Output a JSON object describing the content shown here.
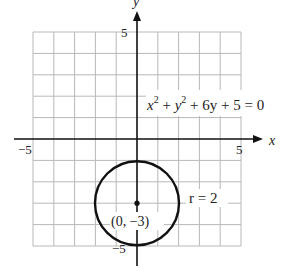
{
  "diagram": {
    "type": "circle-graph",
    "equation": {
      "base": "x",
      "parts": [
        "x",
        "2",
        " + ",
        "y",
        "2",
        " + 6y + 5 = 0"
      ]
    },
    "equation_text": "x² + y² + 6y + 5 = 0",
    "radius_label": "r = 2",
    "center_label": "(0, −3)",
    "axes": {
      "x_label": "x",
      "y_label": "y",
      "x_ticks": [
        "−5",
        "5"
      ],
      "y_ticks": [
        "5",
        "−5"
      ],
      "xlim": [
        -5,
        5
      ],
      "ylim": [
        -5,
        5
      ]
    },
    "circle": {
      "center": [
        0,
        -3
      ],
      "radius": 2
    },
    "colors": {
      "grid": "#b8b8b8",
      "axis": "#111111",
      "curve": "#111111"
    }
  }
}
